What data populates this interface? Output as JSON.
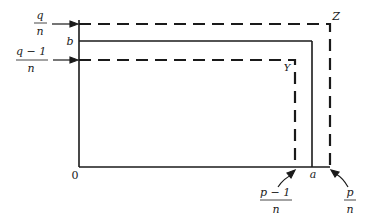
{
  "diagram": {
    "origin_label": "0",
    "labels": {
      "q_over_n": {
        "num": "q",
        "den": "n"
      },
      "q_minus_1_over_n": {
        "num": "q − 1",
        "den": "n"
      },
      "p_minus_1_over_n": {
        "num": "p − 1",
        "den": "n"
      },
      "p_over_n": {
        "num": "p",
        "den": "n"
      },
      "b": "b",
      "a": "a",
      "Y": "Y",
      "Z": "Z"
    },
    "colors": {
      "line": "#1a1a1a",
      "background": "#ffffff"
    }
  }
}
